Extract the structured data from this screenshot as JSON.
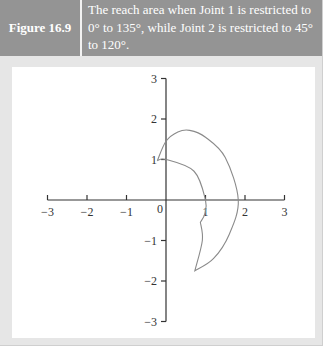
{
  "figure": {
    "label": "Figure 16.9",
    "caption": "The reach area when Joint 1 is restricted to 0° to 135°, while Joint 2 is restricted to 45° to 120°."
  },
  "colors": {
    "header_bg": "#949494",
    "frame_bg": "#e6e6e6",
    "axis": "#333333",
    "curve": "#8a8a8a"
  },
  "chart_data": {
    "type": "line",
    "title": "",
    "xlabel": "",
    "ylabel": "",
    "xlim": [
      -3,
      3
    ],
    "ylim": [
      -3,
      3
    ],
    "grid": false,
    "legend": null,
    "x_ticks": [
      "-3",
      "-2",
      "-1",
      "0",
      "1",
      "2",
      "3"
    ],
    "y_ticks": [
      "3",
      "2",
      "1",
      "-1",
      "-2",
      "-3"
    ],
    "origin_label": "0",
    "series": [
      {
        "name": "reach-area-boundary",
        "description": "Closed boundary of reachable workspace: outer arc from (-0.22,0.97) through peak (0.6,1.72) to (1.83,0) and down to tip (0.73,-1.75); inner arc radius 1 from (0,1) to (1,0), notch near (0.87,-0.55), back to tip.",
        "points": [
          [
            -0.22,
            0.97
          ],
          [
            0,
            1.45
          ],
          [
            0.3,
            1.68
          ],
          [
            0.6,
            1.72
          ],
          [
            1.0,
            1.55
          ],
          [
            1.5,
            1.05
          ],
          [
            1.83,
            0
          ],
          [
            1.6,
            -0.85
          ],
          [
            1.2,
            -1.45
          ],
          [
            0.73,
            -1.75
          ],
          [
            0.92,
            -1.0
          ],
          [
            0.87,
            -0.55
          ],
          [
            0.98,
            -0.35
          ],
          [
            1.0,
            0
          ],
          [
            0.71,
            0.71
          ],
          [
            0,
            1.0
          ],
          [
            -0.22,
            0.97
          ]
        ]
      }
    ]
  }
}
